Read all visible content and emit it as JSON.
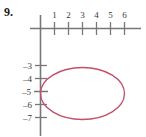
{
  "problem": {
    "number": "9."
  },
  "chart_data": {
    "type": "line",
    "title": "",
    "xlabel": "",
    "ylabel": "",
    "curve": "ellipse",
    "center": [
      3,
      -5
    ],
    "semi_axis_x": 3,
    "semi_axis_y": 2,
    "equation": "(x-3)^2/9 + (y+5)^2/4 = 1",
    "x_ticks": [
      1,
      2,
      3,
      4,
      5,
      6
    ],
    "x_tick_labels": [
      "1",
      "2",
      "3",
      "4",
      "5",
      "6"
    ],
    "y_ticks": [
      -3,
      -4,
      -5,
      -6,
      -7
    ],
    "y_tick_labels": [
      "–3",
      "–4",
      "–5",
      "–6",
      "–7"
    ],
    "xlim": [
      -0.6,
      7.0
    ],
    "ylim": [
      -8.2,
      1.6
    ],
    "grid": false,
    "legend": null,
    "curve_color": "#C3506A",
    "axis_color": "#77777a",
    "tick_label_color": "#3a3a3a"
  }
}
